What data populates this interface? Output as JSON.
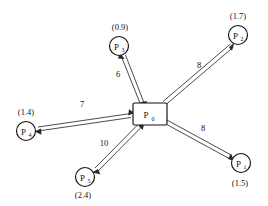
{
  "diagram": {
    "center": {
      "id": "P0",
      "label": "P",
      "subscript": "0",
      "shape": "rectangle"
    },
    "nodes": [
      {
        "id": "P1",
        "label": "P",
        "subscript": "1",
        "value": "(1.5)",
        "weight": "8",
        "position": "bottom-right"
      },
      {
        "id": "P2",
        "label": "P",
        "subscript": "2",
        "value": "(1.7)",
        "weight": "8",
        "position": "top-right"
      },
      {
        "id": "P3",
        "label": "P",
        "subscript": "3",
        "value": "(0.9)",
        "weight": "6",
        "position": "top"
      },
      {
        "id": "P4",
        "label": "P",
        "subscript": "4",
        "value": "(1.4)",
        "weight": "7",
        "position": "left"
      },
      {
        "id": "P5",
        "label": "P",
        "subscript": "5",
        "value": "(2.4)",
        "weight": "10",
        "position": "bottom-left"
      }
    ],
    "colors": {
      "stroke": "#111111",
      "line": "#2b2b2b",
      "background": "#ffffff"
    }
  }
}
